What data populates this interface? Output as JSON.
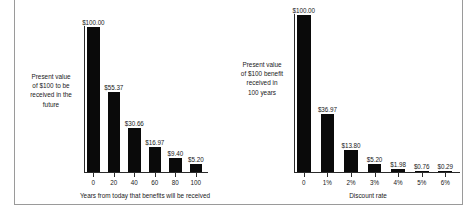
{
  "figure": {
    "background": "#ffffff",
    "bar_color": "#0a0a0a",
    "axis_color": "#2b2b2b",
    "frame_color": "#9a9a9a"
  },
  "chart_data": [
    {
      "type": "bar",
      "id": "present-value-by-years",
      "title": "",
      "categories": [
        "0",
        "20",
        "40",
        "60",
        "80",
        "100"
      ],
      "values": [
        100.0,
        55.37,
        30.66,
        16.97,
        9.4,
        5.2
      ],
      "data_labels": [
        "$100.00",
        "$55.37",
        "$30.66",
        "$16.97",
        "$9.40",
        "$5.20"
      ],
      "xlabel": "Years from today that benefits will be received",
      "ylabel": "Present value of $100 to be received in the future",
      "ylabel_lines": [
        "Present value",
        "of $100 to be",
        "received in the",
        "future"
      ],
      "ylim": [
        0,
        100
      ],
      "grid": false,
      "legend": "none"
    },
    {
      "type": "bar",
      "id": "present-value-by-discount-rate",
      "title": "",
      "categories": [
        "0",
        "1%",
        "2%",
        "3%",
        "4%",
        "5%",
        "6%"
      ],
      "values": [
        100.0,
        36.97,
        13.8,
        5.2,
        1.98,
        0.76,
        0.29
      ],
      "data_labels": [
        "$100.00",
        "$36.97",
        "$13.80",
        "$5.20",
        "$1.98",
        "$0.76",
        "$0.29"
      ],
      "xlabel": "Discount rate",
      "ylabel": "Present value of $100 benefit received in 100 years",
      "ylabel_lines": [
        "Present value",
        "of $100 benefit",
        "received in",
        "100 years"
      ],
      "ylim": [
        0,
        100
      ],
      "grid": false,
      "legend": "none"
    }
  ]
}
